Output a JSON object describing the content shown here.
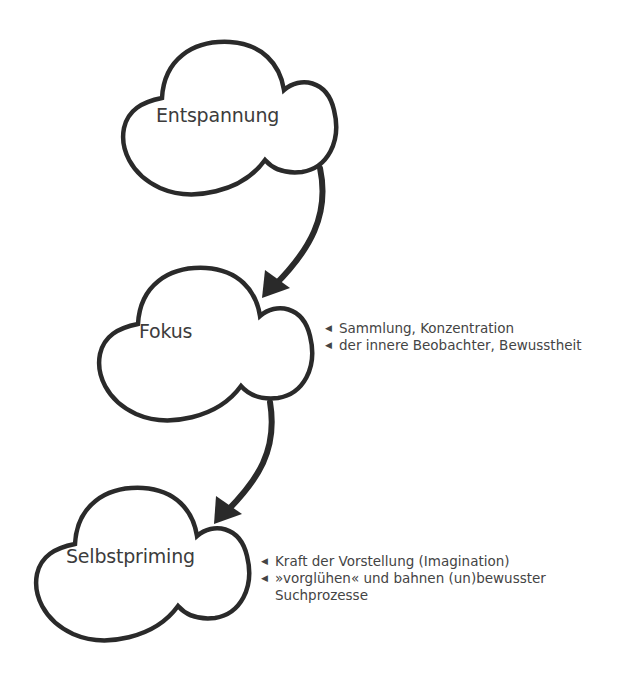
{
  "diagram": {
    "type": "flow",
    "colors": {
      "stroke": "#2a2a2a",
      "text": "#3c3c3c",
      "background": "#ffffff"
    },
    "nodes": [
      {
        "id": "entspannung",
        "label": "Entspannung",
        "shape": "cloud"
      },
      {
        "id": "fokus",
        "label": "Fokus",
        "shape": "cloud"
      },
      {
        "id": "selbstpriming",
        "label": "Selbstpriming",
        "shape": "cloud"
      }
    ],
    "edges": [
      {
        "from": "entspannung",
        "to": "fokus",
        "style": "curved-arrow"
      },
      {
        "from": "fokus",
        "to": "selbstpriming",
        "style": "curved-arrow"
      }
    ],
    "annotations": {
      "fokus": {
        "bullet_icon": "◀",
        "items": [
          "Sammlung, Konzentration",
          "der innere Beobachter, Bewusstheit"
        ]
      },
      "selbstpriming": {
        "bullet_icon": "◀",
        "items": [
          "Kraft der Vorstellung (Imagination)",
          "»vorglühen« und bahnen (un)bewusster"
        ],
        "continuation": "Suchprozesse"
      }
    }
  }
}
